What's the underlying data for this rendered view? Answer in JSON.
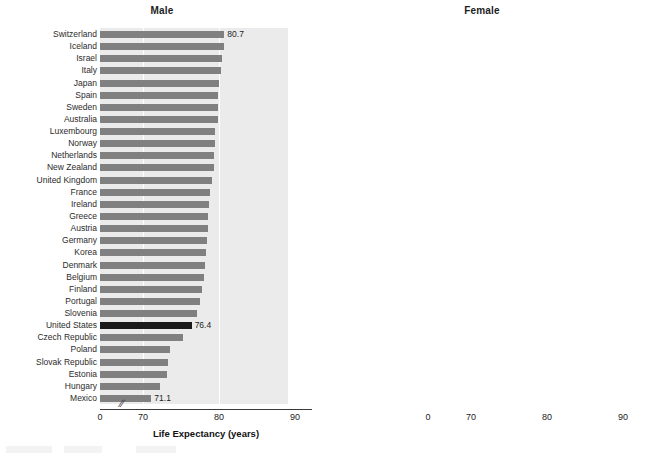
{
  "figure": {
    "panels": [
      {
        "key": "male",
        "title": "Male"
      },
      {
        "key": "female",
        "title": "Female"
      }
    ],
    "axis_title": "Life Expectancy (years)",
    "axis_break_glyph": "//",
    "tick_labels": [
      "0",
      "70",
      "80",
      "90"
    ],
    "bar_color": "#808080",
    "highlight_color": "#1a1a1a",
    "plot_background": "#ebebeb",
    "gridline_color": "#ffffff"
  },
  "chart_data": [
    {
      "type": "bar",
      "orientation": "horizontal",
      "title": "Male",
      "xlabel": "Life Expectancy (years)",
      "ylabel": "",
      "xlim": [
        0,
        90
      ],
      "axis_break": {
        "from": 0,
        "to": 68.3,
        "glyph": "//"
      },
      "xticks": [
        0,
        70,
        80,
        90
      ],
      "grid": "vertical-white-at-70-and-80",
      "legend": "none",
      "highlight_category": "United States",
      "labeled_points": [
        {
          "category": "Switzerland",
          "value": 80.7,
          "label": "80.7"
        },
        {
          "category": "United States",
          "value": 76.4,
          "label": "76.4"
        },
        {
          "category": "Mexico",
          "value": 71.1,
          "label": "71.1"
        }
      ],
      "categories": [
        "Switzerland",
        "Iceland",
        "Israel",
        "Italy",
        "Japan",
        "Spain",
        "Sweden",
        "Australia",
        "Luxembourg",
        "Norway",
        "Netherlands",
        "New Zealand",
        "United Kingdom",
        "France",
        "Ireland",
        "Greece",
        "Austria",
        "Germany",
        "Korea",
        "Denmark",
        "Belgium",
        "Finland",
        "Portugal",
        "Slovenia",
        "United States",
        "Czech Republic",
        "Poland",
        "Slovak Republic",
        "Estonia",
        "Hungary",
        "Mexico"
      ],
      "values": [
        80.7,
        80.6,
        80.4,
        80.2,
        80.0,
        79.9,
        79.9,
        79.9,
        79.5,
        79.5,
        79.4,
        79.3,
        79.1,
        78.8,
        78.7,
        78.5,
        78.5,
        78.4,
        78.3,
        78.1,
        78.0,
        77.7,
        77.5,
        77.1,
        76.4,
        75.3,
        73.5,
        73.3,
        73.2,
        72.2,
        71.1
      ]
    },
    {
      "type": "bar",
      "orientation": "horizontal",
      "title": "Female",
      "xlabel": "Life Expectancy (years)",
      "ylabel": "",
      "xlim": [
        0,
        90
      ],
      "axis_break": {
        "from": 0,
        "to": 68.3,
        "glyph": "//"
      },
      "xticks": [
        0,
        70,
        80,
        90
      ],
      "grid": "vertical-white-at-70-and-80",
      "legend": "none",
      "highlight_category": "United States",
      "labeled_points": [
        {
          "category": "Japan",
          "value": 86.6,
          "label": "86.6"
        },
        {
          "category": "United States",
          "value": 81.2,
          "label": "81.2"
        },
        {
          "category": "Mexico",
          "value": 77.4,
          "label": "77.4"
        }
      ],
      "categories": [
        "Japan",
        "Spain",
        "France",
        "Italy",
        "Korea",
        "Switzerland",
        "Australia",
        "Finland",
        "Greece",
        "Portugal",
        "Israel",
        "Luxembourg",
        "Austria",
        "Norway",
        "Sweden",
        "Iceland",
        "Slovenia",
        "Belgium",
        "Germany",
        "Netherlands",
        "New Zealand",
        "Ireland",
        "United Kingdom",
        "Denmark",
        "Estonia",
        "Czech Republic",
        "Poland",
        "United States",
        "Slovak Republic",
        "Hungary",
        "Mexico"
      ],
      "values": [
        86.6,
        85.5,
        85.4,
        85.2,
        85.1,
        85.1,
        84.6,
        84.4,
        84.2,
        84.2,
        84.2,
        84.1,
        84.0,
        84.0,
        83.8,
        83.8,
        83.8,
        83.5,
        83.4,
        83.3,
        83.2,
        83.2,
        83.0,
        82.4,
        82.1,
        81.7,
        81.6,
        81.2,
        80.2,
        79.6,
        77.4
      ]
    }
  ]
}
